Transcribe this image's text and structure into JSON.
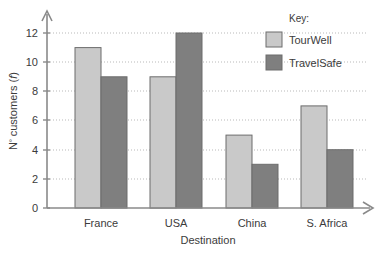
{
  "chart_data": {
    "type": "bar",
    "title": "",
    "xlabel": "Destination",
    "ylabel": "Nº customers (f)",
    "ylabel_prefix": "N",
    "ylabel_sup": "º",
    "ylabel_mid": " customers (",
    "ylabel_italic": "f",
    "ylabel_suffix": ")",
    "categories": [
      "France",
      "USA",
      "China",
      "S. Africa"
    ],
    "series": [
      {
        "name": "TourWell",
        "values": [
          11,
          9,
          5,
          7
        ],
        "color": "#c9c9c9"
      },
      {
        "name": "TravelSafe",
        "values": [
          9,
          12,
          3,
          4
        ],
        "color": "#7f7f7f"
      }
    ],
    "ylim": [
      0,
      13
    ],
    "yticks": [
      0,
      2,
      4,
      6,
      8,
      10,
      12
    ],
    "ytick_labels": [
      "0",
      "2",
      "4",
      "6",
      "8",
      "10",
      "12"
    ],
    "grid": true,
    "grid_axis": "y",
    "legend": {
      "title": "Key:",
      "position": "top-right",
      "entries": [
        "TourWell",
        "TravelSafe"
      ]
    }
  },
  "colors": {
    "series_light": "#c9c9c9",
    "series_dark": "#7f7f7f",
    "axis": "#8a8a8a",
    "grid": "#b9b9b9",
    "text": "#3b3b3b",
    "bar_stroke": "#6d6d6d",
    "background": "#ffffff"
  }
}
